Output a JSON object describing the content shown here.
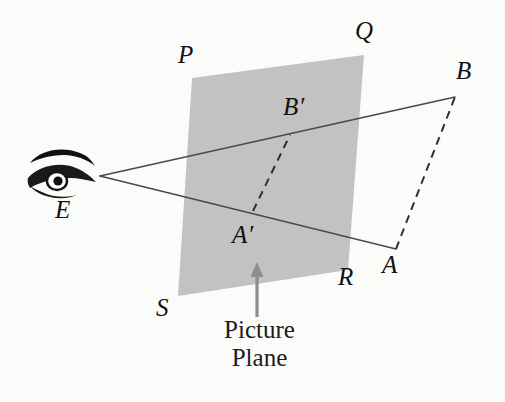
{
  "figure": {
    "background_color": "#fbfbfa",
    "plane_fill": "#c2c2c2",
    "line_color": "#4a4a4a",
    "dash_color": "#3a3a3a",
    "arrow_color": "#8d8d8d",
    "label_color": "#111111"
  },
  "caption": {
    "line1": "Picture",
    "line2": "Plane"
  },
  "labels": {
    "P": "P",
    "Q": "Q",
    "R": "R",
    "S": "S",
    "A": "A",
    "B": "B",
    "A_prime": "A′",
    "B_prime": "B′",
    "E": "E"
  },
  "points": {
    "E": {
      "x": 100,
      "y": 176
    },
    "A": {
      "x": 396,
      "y": 249
    },
    "B": {
      "x": 455,
      "y": 97
    },
    "A_prime": {
      "x": 253,
      "y": 211
    },
    "B_prime": {
      "x": 290,
      "y": 135
    },
    "P": {
      "x": 192,
      "y": 78
    },
    "Q": {
      "x": 364,
      "y": 55
    },
    "R": {
      "x": 348,
      "y": 270
    },
    "S": {
      "x": 178,
      "y": 296
    }
  },
  "segments": [
    {
      "name": "ray-E-to-A",
      "from": "E",
      "to": "A",
      "style": "solid"
    },
    {
      "name": "ray-E-to-B",
      "from": "E",
      "to": "B",
      "style": "solid"
    },
    {
      "name": "object-segment-A-B",
      "from": "A",
      "to": "B",
      "style": "dashed"
    },
    {
      "name": "image-segment-Aprime-Bprime",
      "from": "A_prime",
      "to": "B_prime",
      "style": "dashed"
    }
  ],
  "plane": {
    "name": "picture-plane",
    "vertices": [
      "P",
      "Q",
      "R",
      "S"
    ]
  },
  "arrow": {
    "name": "picture-plane-pointer",
    "from": {
      "x": 257,
      "y": 316
    },
    "to": {
      "x": 257,
      "y": 264
    }
  }
}
